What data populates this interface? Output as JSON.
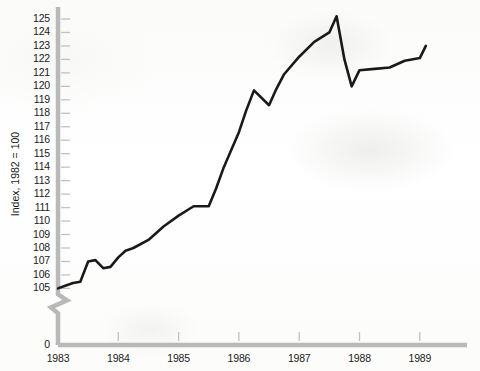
{
  "chart_data": {
    "type": "line",
    "title": "",
    "xlabel": "",
    "ylabel": "Index, 1982 = 100",
    "ylim": [
      105,
      125.5
    ],
    "xlim": [
      1983.0,
      1989.1
    ],
    "grid": false,
    "legend": null,
    "y_axis_break": true,
    "y_axis_break_label": "0",
    "y_tick_labels": [
      "125",
      "124",
      "123",
      "122",
      "121",
      "120",
      "119",
      "118",
      "117",
      "116",
      "115",
      "114",
      "113",
      "112",
      "111",
      "110",
      "109",
      "108",
      "107",
      "106",
      "105",
      "0"
    ],
    "y_ticks": [
      125,
      124,
      123,
      122,
      121,
      120,
      119,
      118,
      117,
      116,
      115,
      114,
      113,
      112,
      111,
      110,
      109,
      108,
      107,
      106,
      105
    ],
    "x_tick_labels": [
      "1983",
      "1984",
      "1985",
      "1986",
      "1987",
      "1988",
      "1989"
    ],
    "x_ticks": [
      1983,
      1984,
      1985,
      1986,
      1987,
      1988,
      1989
    ],
    "series": [
      {
        "name": "Index",
        "color": "#1a1a1a",
        "x": [
          1983.0,
          1983.12,
          1983.25,
          1983.37,
          1983.5,
          1983.62,
          1983.75,
          1983.87,
          1984.0,
          1984.12,
          1984.25,
          1984.5,
          1984.75,
          1985.0,
          1985.25,
          1985.5,
          1985.62,
          1985.75,
          1986.0,
          1986.12,
          1986.25,
          1986.5,
          1986.62,
          1986.75,
          1987.0,
          1987.25,
          1987.5,
          1987.62,
          1987.75,
          1987.87,
          1988.0,
          1988.25,
          1988.5,
          1988.75,
          1989.0,
          1989.1
        ],
        "y": [
          105.0,
          105.2,
          105.4,
          105.5,
          107.0,
          107.1,
          106.5,
          106.6,
          107.3,
          107.8,
          108.0,
          108.6,
          109.6,
          110.4,
          111.1,
          111.1,
          112.4,
          114.0,
          116.6,
          118.2,
          119.7,
          118.6,
          119.8,
          120.9,
          122.2,
          123.3,
          124.0,
          125.2,
          122.0,
          120.0,
          121.2,
          121.3,
          121.4,
          121.9,
          122.1,
          123.0
        ]
      }
    ]
  },
  "axis": {
    "y_title": "Index, 1982 = 100",
    "zero_label": "0"
  }
}
